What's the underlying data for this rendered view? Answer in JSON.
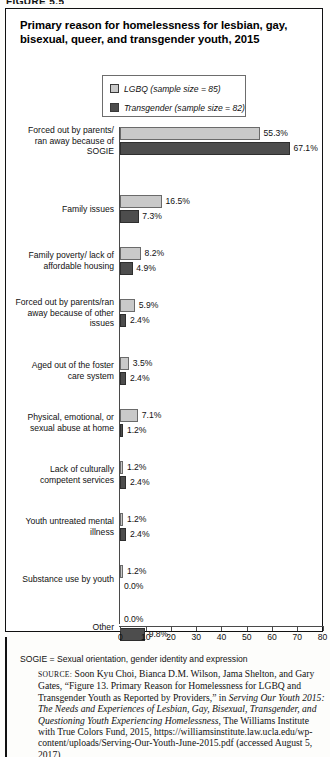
{
  "figure_tag": "FIGURE 5.5",
  "title": "Primary reason for homelessness for lesbian, gay, bisexual, queer, and transgender youth, 2015",
  "legend": {
    "items": [
      {
        "label": "LGBQ (sample size = 85)",
        "key": "lgbq",
        "color": "#c9c9c9"
      },
      {
        "label": "Transgender (sample size = 82)",
        "key": "trans",
        "color": "#4d4d4d"
      }
    ]
  },
  "note": "SOGIE = Sexual orientation, gender identity and expression",
  "source": {
    "label": "SOURCE:",
    "part1": " Soon Kyu Choi, Bianca D.M. Wilson, Jama Shelton, and Gary Gates, “Figure 13. Primary Reason for Homelessness for LGBQ and Transgender Youth as Reported by Providers,” in ",
    "italic1": "Serving Our Youth 2015: The Needs and Experiences of Lesbian, Gay, Bisexual, Transgender, and Questioning Youth Experiencing Homelessness,",
    "part2": " The Williams Institute with True Colors Fund, 2015, https://williamsinstitute.law.ucla.edu/wp-content/uploads/Serving-Our-Youth-June-2015.pdf (accessed August 5, 2017)"
  },
  "chart_data": {
    "type": "bar",
    "orientation": "horizontal",
    "title": "Primary reason for homelessness for lesbian, gay, bisexual, queer, and transgender youth, 2015",
    "xlabel": "",
    "ylabel": "",
    "xlim": [
      0,
      80
    ],
    "xticks": [
      0,
      10,
      20,
      30,
      40,
      50,
      60,
      70,
      80
    ],
    "grid": false,
    "legend_position": "top",
    "categories": [
      "Forced out by parents/ ran away because of SOGIE",
      "Family issues",
      "Family poverty/ lack of affordable housing",
      "Forced out by parents/ran away because of other issues",
      "Aged out of the foster care system",
      "Physical, emotional, or sexual abuse at home",
      "Lack of culturally competent services",
      "Youth untreated mental illness",
      "Substance use by youth",
      "Other"
    ],
    "category_lines": [
      [
        "Forced out by parents/",
        "ran away because of",
        "SOGIE"
      ],
      [
        "Family issues"
      ],
      [
        "Family poverty/ lack of",
        "affordable housing"
      ],
      [
        "Forced out by parents/ran",
        "away because of other",
        "issues"
      ],
      [
        "Aged out of the foster",
        "care system"
      ],
      [
        "Physical, emotional, or",
        "sexual abuse at home"
      ],
      [
        "Lack of culturally",
        "competent services"
      ],
      [
        "Youth untreated mental",
        "illness"
      ],
      [
        "Substance use by youth"
      ],
      [
        "Other"
      ]
    ],
    "series": [
      {
        "name": "LGBQ (sample size = 85)",
        "color": "#c9c9c9",
        "values": [
          55.3,
          16.5,
          8.2,
          5.9,
          3.5,
          7.1,
          1.2,
          1.2,
          1.2,
          0.0
        ],
        "labels": [
          "55.3%",
          "16.5%",
          "8.2%",
          "5.9%",
          "3.5%",
          "7.1%",
          "1.2%",
          "1.2%",
          "1.2%",
          "0.0%"
        ]
      },
      {
        "name": "Transgender (sample size = 82)",
        "color": "#4d4d4d",
        "values": [
          67.1,
          7.3,
          4.9,
          2.4,
          2.4,
          1.2,
          2.4,
          2.4,
          0.0,
          9.8
        ],
        "labels": [
          "67.1%",
          "7.3%",
          "4.9%",
          "2.4%",
          "2.4%",
          "1.2%",
          "2.4%",
          "2.4%",
          "0.0%",
          "9.8%"
        ]
      }
    ]
  }
}
